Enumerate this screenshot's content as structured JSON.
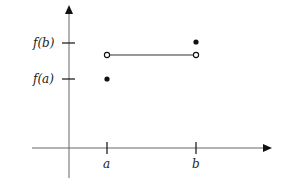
{
  "diagram": {
    "title": "",
    "colors": {
      "axis": "#555555",
      "line": "#333333",
      "dot": "#111111",
      "background": "#ffffff"
    },
    "x_axis": {
      "ticks": [
        {
          "label": "a",
          "x": 107
        },
        {
          "label": "b",
          "x": 196
        }
      ]
    },
    "y_axis": {
      "ticks": [
        {
          "label": "f(b)",
          "y": 43
        },
        {
          "label": "f(a)",
          "y": 79
        }
      ]
    },
    "points": [
      {
        "name": "f-a-point",
        "type": "filled",
        "x": 107,
        "y": 79
      },
      {
        "name": "left-open-endpoint",
        "type": "open",
        "x": 107,
        "y": 55
      },
      {
        "name": "right-open-endpoint",
        "type": "open",
        "x": 196,
        "y": 55
      },
      {
        "name": "f-b-point",
        "type": "filled",
        "x": 196,
        "y": 42
      }
    ],
    "segments": [
      {
        "name": "constant-segment",
        "from": [
          107,
          55
        ],
        "to": [
          196,
          55
        ]
      }
    ]
  }
}
